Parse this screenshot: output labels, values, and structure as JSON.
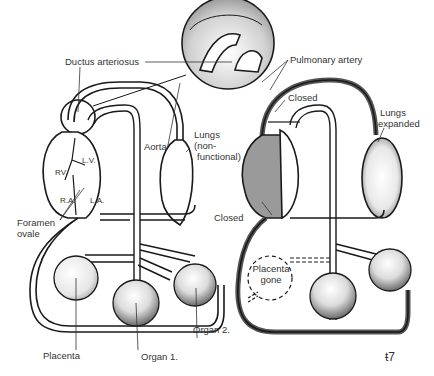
{
  "diagram": {
    "type": "fetal-vs-newborn-circulation",
    "left_panel": {
      "title": "",
      "labels": {
        "ductus_arteriosus": "Ductus arteriosus",
        "aorta": "Aorta",
        "lungs": "Lungs",
        "lungs_note_1": "(non-",
        "lungs_note_2": "functional)",
        "rv": "RV.",
        "lv": "L.V.",
        "ra": "R.A.",
        "la": "L.A.",
        "foramen_1": "Foramen",
        "foramen_2": "ovale",
        "placenta": "Placenta",
        "organ1": "Organ 1.",
        "organ2": "Organ 2."
      }
    },
    "right_panel": {
      "labels": {
        "pulmonary_artery": "Pulmonary artery",
        "closed_top": "Closed",
        "lungs_1": "Lungs",
        "lungs_2": "expanded",
        "closed_mid": "Closed",
        "placenta_gone_1": "Placenta",
        "placenta_gone_2": "gone"
      }
    },
    "signature": "ŧ7",
    "colors": {
      "ink": "#1a1a1a",
      "stipple": "#8a8a8a",
      "paper": "#ffffff"
    }
  }
}
